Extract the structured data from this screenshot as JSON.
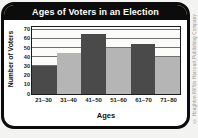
{
  "page": {
    "credit": "© Houghton Mifflin Harcourt Publishing Company"
  },
  "chart_data": {
    "type": "bar",
    "title": "Ages of Voters in an Election",
    "xlabel": "Ages",
    "ylabel": "Number of Voters",
    "categories": [
      "21–30",
      "31–40",
      "41–50",
      "51–60",
      "61–70",
      "71–80"
    ],
    "values": [
      30,
      45,
      65,
      50,
      55,
      40
    ],
    "ylim": [
      0,
      70
    ],
    "yticks": [
      0,
      10,
      20,
      30,
      40,
      50,
      60,
      70
    ],
    "grid": true,
    "legend": "none",
    "colors": {
      "dark_bar": "#4a4a4a",
      "light_bar": "#b5b5b5",
      "title_bg": "#0c0c0c",
      "title_text": "#ffffff",
      "gridline": "#6f6f6f"
    }
  }
}
